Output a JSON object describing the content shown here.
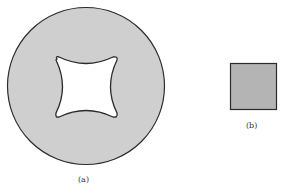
{
  "figure_a": {
    "label": "(a)",
    "description": "gray disk with white concave-square (astroid-like) hole",
    "fill": "#cfcfcf",
    "stroke": "#2b2b2b"
  },
  "figure_b": {
    "label": "(b)",
    "description": "gray filled square",
    "fill": "#b4b4b4",
    "stroke": "#2b2b2b"
  }
}
